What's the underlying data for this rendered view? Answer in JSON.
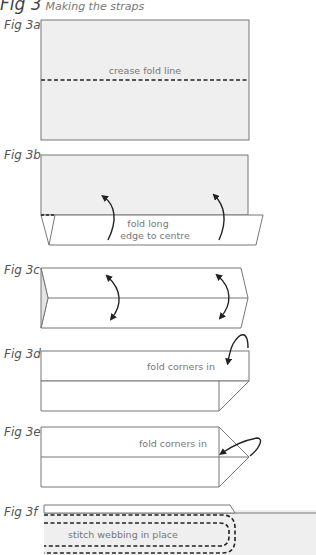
{
  "title": {
    "fig": "Fig 3",
    "subtitle": "Making the straps"
  },
  "figures": [
    {
      "label": "Fig 3a",
      "annotation": "crease fold line"
    },
    {
      "label": "Fig 3b",
      "annotation_line1": "fold long",
      "annotation_line2": "edge to centre"
    },
    {
      "label": "Fig 3c"
    },
    {
      "label": "Fig 3d",
      "annotation": "fold corners in"
    },
    {
      "label": "Fig 3e",
      "annotation": "fold corners in"
    },
    {
      "label": "Fig 3f",
      "annotation": "stitch webbing in place"
    }
  ],
  "colors": {
    "fabric": "#efefef",
    "line": "#777777",
    "arrow": "#222222",
    "dash": "#222222"
  }
}
